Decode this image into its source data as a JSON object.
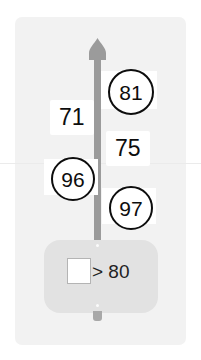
{
  "figure": {
    "background_color": "#ffffff",
    "panel_color": "#f2f2f2",
    "shaft_color": "#9b9b9b",
    "body_color": "#e2e2e2",
    "annotation_color": "#0d0d0d"
  },
  "legend": {
    "swatch_name": "white-square-swatch",
    "text": "> 80"
  },
  "annotations": [
    {
      "name": "annotation-81",
      "value": "81",
      "style": "circled"
    },
    {
      "name": "annotation-71",
      "value": "71",
      "style": "plain"
    },
    {
      "name": "annotation-75",
      "value": "75",
      "style": "plain"
    },
    {
      "name": "annotation-96",
      "value": "96",
      "style": "circled"
    },
    {
      "name": "annotation-97",
      "value": "97",
      "style": "plain-circled"
    }
  ],
  "labels": {
    "l81": "81",
    "l71": "71",
    "l75": "75",
    "l96": "96",
    "l97": "97"
  }
}
